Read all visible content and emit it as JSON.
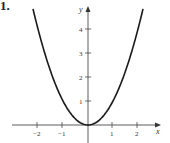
{
  "problem_number": "1.",
  "chart_data": {
    "type": "line",
    "title": "",
    "function": "y = x^2",
    "xlabel": "x",
    "ylabel": "y",
    "x_ticks": [
      "−2",
      "−1",
      "1",
      "2"
    ],
    "y_ticks": [
      "1",
      "2",
      "3",
      "4"
    ],
    "xlim": [
      -3.2,
      3
    ],
    "ylim": [
      -0.4,
      5
    ],
    "grid": false,
    "series": [
      {
        "name": "y = x^2",
        "x": [
          -2.2,
          -2,
          -1.5,
          -1,
          -0.5,
          0,
          0.5,
          1,
          1.5,
          2,
          2.2
        ],
        "y": [
          4.84,
          4,
          2.25,
          1,
          0.25,
          0,
          0.25,
          1,
          2.25,
          4,
          4.84
        ]
      }
    ]
  },
  "colors": {
    "curve": "#1a1a1a",
    "axis": "#333333"
  }
}
